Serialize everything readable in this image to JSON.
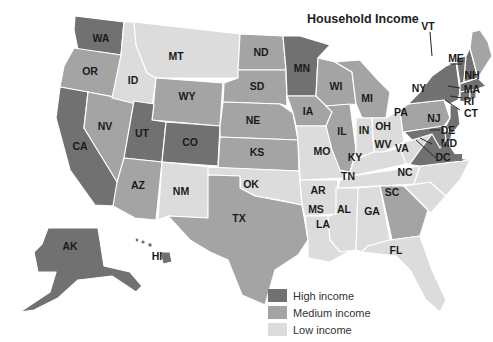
{
  "title": "Household Income",
  "colors": {
    "high": "#717171",
    "medium": "#a4a4a4",
    "low": "#dcdcdc"
  },
  "legend": [
    {
      "key": "high",
      "label": "High income",
      "color": "#717171"
    },
    {
      "key": "medium",
      "label": "Medium income",
      "color": "#a4a4a4"
    },
    {
      "key": "low",
      "label": "Low income",
      "color": "#dcdcdc"
    }
  ],
  "states": {
    "high": [
      "WA",
      "CA",
      "UT",
      "CO",
      "MN",
      "NY",
      "VT",
      "NH",
      "MA",
      "RI",
      "CT",
      "NJ",
      "DE",
      "MD",
      "VA",
      "DC",
      "AK",
      "HI"
    ],
    "medium": [
      "OR",
      "NV",
      "WY",
      "ND",
      "SD",
      "NE",
      "KS",
      "AZ",
      "TX",
      "WI",
      "IA",
      "MI",
      "IL",
      "PA",
      "GA",
      "ME"
    ],
    "low": [
      "ID",
      "MT",
      "NM",
      "OK",
      "MO",
      "AR",
      "LA",
      "MS",
      "AL",
      "TN",
      "KY",
      "IN",
      "OH",
      "WV",
      "NC",
      "SC",
      "FL"
    ]
  },
  "labels": {
    "WA": "WA",
    "OR": "OR",
    "CA": "CA",
    "NV": "NV",
    "ID": "ID",
    "MT": "MT",
    "WY": "WY",
    "UT": "UT",
    "CO": "CO",
    "AZ": "AZ",
    "NM": "NM",
    "ND": "ND",
    "SD": "SD",
    "NE": "NE",
    "KS": "KS",
    "OK": "OK",
    "TX": "TX",
    "MN": "MN",
    "IA": "IA",
    "MO": "MO",
    "AR": "AR",
    "LA": "LA",
    "WI": "WI",
    "IL": "IL",
    "MI": "MI",
    "IN": "IN",
    "OH": "OH",
    "KY": "KY",
    "TN": "TN",
    "MS": "MS",
    "AL": "AL",
    "GA": "GA",
    "FL": "FL",
    "SC": "SC",
    "NC": "NC",
    "VA": "VA",
    "WV": "WV",
    "PA": "PA",
    "NY": "NY",
    "VT": "VT",
    "NH": "NH",
    "ME": "ME",
    "MA": "MA",
    "RI": "RI",
    "CT": "CT",
    "NJ": "NJ",
    "DE": "DE",
    "MD": "MD",
    "DC": "DC",
    "AK": "AK",
    "HI": "HI"
  }
}
